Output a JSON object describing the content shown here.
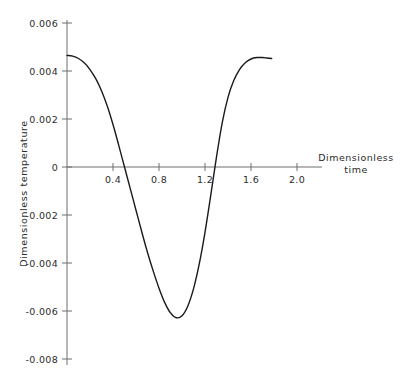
{
  "chart_data": {
    "type": "line",
    "title": "",
    "subtitle": "",
    "xlabel": "Dimensionless time",
    "ylabel": "Dimensionless temperature",
    "xlim": [
      0.0,
      2.1
    ],
    "ylim": [
      -0.008,
      0.0065
    ],
    "grid": false,
    "legend": null,
    "legend_position": "none",
    "xticks": [
      0.4,
      0.8,
      1.2,
      1.6,
      2.0
    ],
    "xtick_labels": [
      "0.4",
      "0.8",
      "1.2",
      "1.6",
      "2.0"
    ],
    "yticks": [
      0.006,
      0.004,
      0.002,
      0,
      -0.002,
      -0.004,
      -0.006,
      -0.008
    ],
    "ytick_labels": [
      "0.006",
      "0.004",
      "0.002",
      "0",
      "-0.002",
      "-0.004",
      "-0.006",
      "-0.008"
    ],
    "zero_crossings": [
      0.5,
      1.28
    ],
    "minimum": {
      "x": 0.92,
      "y": -0.0063
    },
    "maximum": {
      "x": 1.7,
      "y": 0.00455
    },
    "series": [
      {
        "name": "Dimensionless temperature",
        "color": "#1a1a1a",
        "x": [
          0.0,
          0.05,
          0.1,
          0.15,
          0.2,
          0.25,
          0.3,
          0.35,
          0.4,
          0.45,
          0.5,
          0.55,
          0.6,
          0.65,
          0.7,
          0.75,
          0.8,
          0.85,
          0.9,
          0.95,
          1.0,
          1.05,
          1.1,
          1.15,
          1.2,
          1.25,
          1.3,
          1.35,
          1.4,
          1.45,
          1.5,
          1.55,
          1.6,
          1.65,
          1.7,
          1.74,
          1.78
        ],
        "y": [
          0.00465,
          0.00462,
          0.00452,
          0.00434,
          0.00406,
          0.00368,
          0.00318,
          0.00254,
          0.00177,
          0.0009,
          0.0,
          -0.0009,
          -0.0018,
          -0.0027,
          -0.00356,
          -0.00434,
          -0.00505,
          -0.00565,
          -0.00608,
          -0.00628,
          -0.0062,
          -0.0058,
          -0.00508,
          -0.00404,
          -0.00272,
          -0.00118,
          0.00042,
          0.00185,
          0.0029,
          0.0036,
          0.00406,
          0.00434,
          0.0045,
          0.00456,
          0.00456,
          0.00454,
          0.00452
        ]
      }
    ]
  },
  "axis_titles": {
    "x_line1": "Dimensionless",
    "x_line2": "time",
    "y": "Dimensionless temperature"
  },
  "geometry": {
    "x_origin_px": 67,
    "y_zero_px": 167,
    "px_per_x_unit": 115,
    "px_per_y_unit": 24000
  }
}
